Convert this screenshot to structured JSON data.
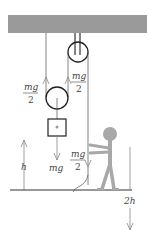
{
  "diagram": {
    "type": "pulley-system",
    "colors": {
      "ceiling": "#9a9a9a",
      "rope": "#555555",
      "arrow": "#888888",
      "person": "#a8a8a8",
      "ground": "#333333"
    },
    "labels": {
      "left_tension_num": "mg",
      "left_tension_den": "2",
      "right_tension_num": "mg",
      "right_tension_den": "2",
      "weight": "mg",
      "pull_num": "mg",
      "pull_den": "2",
      "height": "h",
      "pull_distance": "2h"
    }
  }
}
